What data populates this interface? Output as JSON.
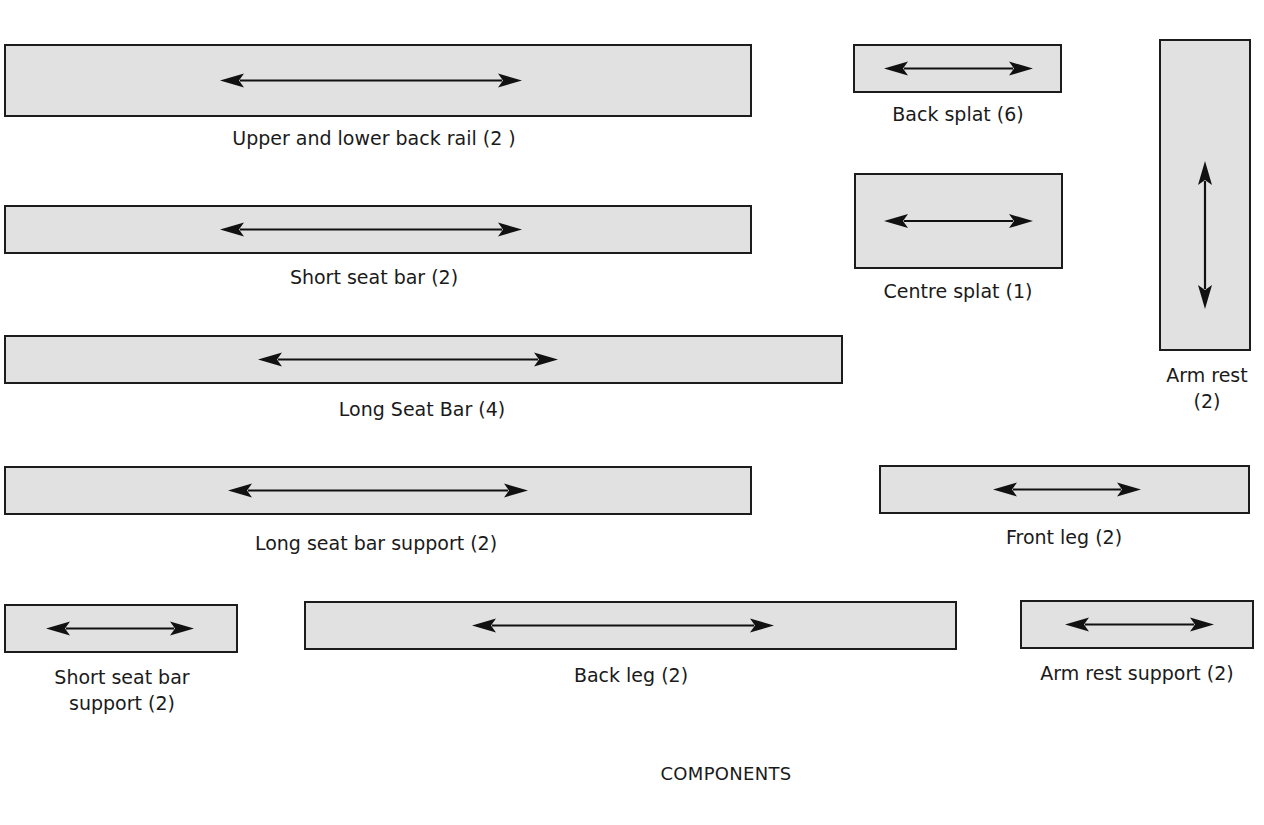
{
  "diagram": {
    "caption": "COMPONENTS",
    "colors": {
      "fill": "#e1e1e1",
      "stroke": "#1c1c1c",
      "arrow": "#111111"
    },
    "parts": [
      {
        "id": "upper-lower-back-rail",
        "label": "Upper and lower back rail (2 )",
        "quantity": 2,
        "rect": [
          4,
          44,
          748,
          73
        ],
        "arrow": "horizontal",
        "arrow_span": [
          220,
          522
        ]
      },
      {
        "id": "back-splat",
        "label": "Back splat (6)",
        "quantity": 6,
        "rect": [
          853,
          44,
          209,
          49
        ],
        "arrow": "horizontal",
        "arrow_span": [
          884,
          1033
        ]
      },
      {
        "id": "arm-rest",
        "label_lines": [
          "Arm rest",
          "(2)"
        ],
        "label": "Arm rest (2)",
        "quantity": 2,
        "rect": [
          1159,
          39,
          92,
          312
        ],
        "arrow": "vertical",
        "arrow_span": [
          122,
          270
        ]
      },
      {
        "id": "short-seat-bar",
        "label": "Short seat bar (2)",
        "quantity": 2,
        "rect": [
          4,
          205,
          748,
          49
        ],
        "arrow": "horizontal",
        "arrow_span": [
          220,
          522
        ]
      },
      {
        "id": "centre-splat",
        "label": "Centre splat (1)",
        "quantity": 1,
        "rect": [
          854,
          173,
          209,
          96
        ],
        "arrow": "horizontal",
        "arrow_span": [
          884,
          1033
        ]
      },
      {
        "id": "long-seat-bar",
        "label": "Long Seat Bar (4)",
        "quantity": 4,
        "rect": [
          4,
          335,
          839,
          49
        ],
        "arrow": "horizontal",
        "arrow_span": [
          258,
          558
        ]
      },
      {
        "id": "long-seat-bar-support",
        "label": "Long seat bar support (2)",
        "quantity": 2,
        "rect": [
          4,
          466,
          748,
          49
        ],
        "arrow": "horizontal",
        "arrow_span": [
          228,
          528
        ]
      },
      {
        "id": "front-leg",
        "label": "Front leg (2)",
        "quantity": 2,
        "rect": [
          879,
          465,
          371,
          49
        ],
        "arrow": "horizontal",
        "arrow_span": [
          993,
          1141
        ]
      },
      {
        "id": "short-seat-bar-support",
        "label_lines": [
          "Short seat bar",
          "support (2)"
        ],
        "label": "Short seat bar support (2)",
        "quantity": 2,
        "rect": [
          4,
          604,
          234,
          49
        ],
        "arrow": "horizontal",
        "arrow_span": [
          46,
          194
        ]
      },
      {
        "id": "back-leg",
        "label": "Back leg (2)",
        "quantity": 2,
        "rect": [
          304,
          601,
          653,
          49
        ],
        "arrow": "horizontal",
        "arrow_span": [
          472,
          774
        ]
      },
      {
        "id": "arm-rest-support",
        "label": "Arm rest support (2)",
        "quantity": 2,
        "rect": [
          1020,
          600,
          234,
          49
        ],
        "arrow": "horizontal",
        "arrow_span": [
          1065,
          1214
        ]
      }
    ],
    "labels": [
      {
        "for": "upper-lower-back-rail",
        "x": 374,
        "y": 125
      },
      {
        "for": "back-splat",
        "x": 958,
        "y": 101
      },
      {
        "for": "arm-rest",
        "x": 1207,
        "y": 362
      },
      {
        "for": "short-seat-bar",
        "x": 374,
        "y": 264
      },
      {
        "for": "centre-splat",
        "x": 958,
        "y": 278
      },
      {
        "for": "long-seat-bar",
        "x": 422,
        "y": 396
      },
      {
        "for": "long-seat-bar-support",
        "x": 376,
        "y": 530
      },
      {
        "for": "front-leg",
        "x": 1064,
        "y": 524
      },
      {
        "for": "short-seat-bar-support",
        "x": 122,
        "y": 664
      },
      {
        "for": "back-leg",
        "x": 631,
        "y": 662
      },
      {
        "for": "arm-rest-support",
        "x": 1137,
        "y": 660
      }
    ]
  }
}
